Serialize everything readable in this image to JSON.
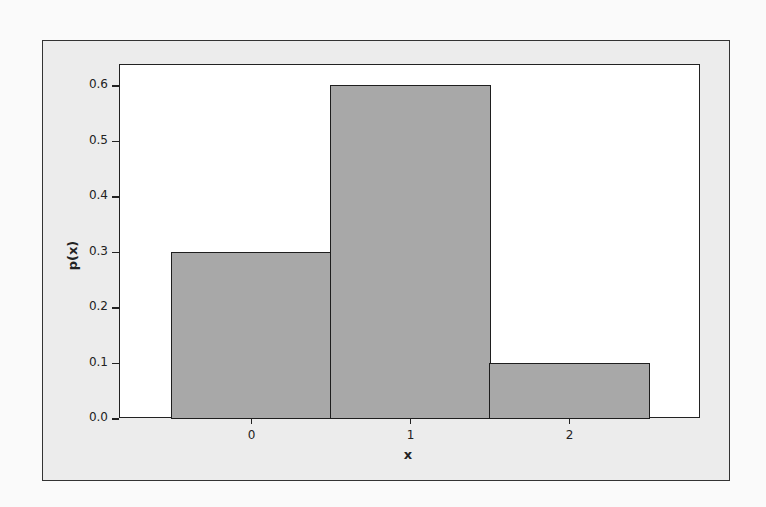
{
  "chart_data": {
    "type": "bar",
    "title": "",
    "xlabel": "x",
    "ylabel": "p(x)",
    "categories": [
      "0",
      "1",
      "2"
    ],
    "values": [
      0.3,
      0.6,
      0.1
    ],
    "ylim": [
      0.0,
      0.6
    ],
    "yticks": [
      "0.0",
      "0.1",
      "0.2",
      "0.3",
      "0.4",
      "0.5",
      "0.6"
    ],
    "grid": false,
    "legend": null,
    "bar_color": "#a8a8a8",
    "bar_edge_color": "#1e1e1e"
  }
}
